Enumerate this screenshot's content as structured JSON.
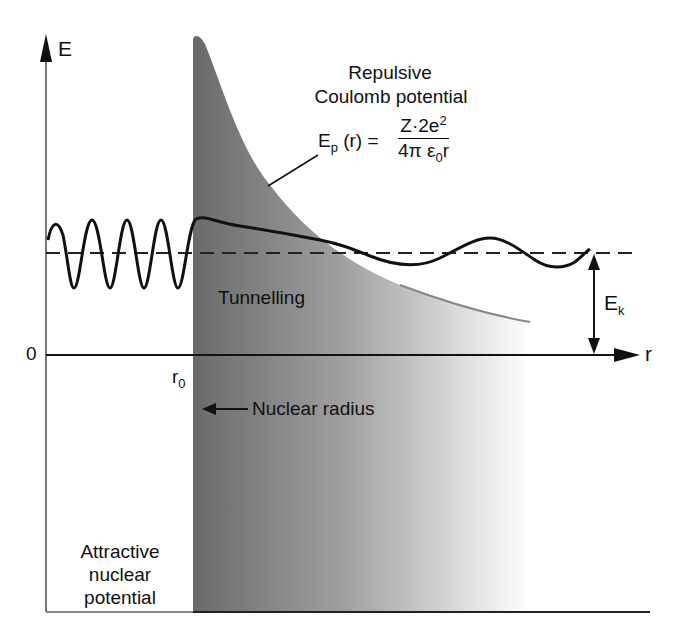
{
  "axes": {
    "y_label": "E",
    "x_label": "r",
    "origin_label": "0",
    "r0_label": "r",
    "r0_sub": "0"
  },
  "labels": {
    "repulsive_title_1": "Repulsive",
    "repulsive_title_2": "Coulomb potential",
    "tunnelling": "Tunnelling",
    "nuclear_radius": "Nuclear radius",
    "attractive_1": "Attractive",
    "attractive_2": "nuclear",
    "attractive_3": "potential",
    "ek_main": "E",
    "ek_sub": "k"
  },
  "formula": {
    "lhs_main": "E",
    "lhs_sub": "p",
    "lhs_rest": "(r) =",
    "numerator_main": "Z·2e",
    "numerator_sup": "2",
    "denominator_main": "4π ε",
    "denominator_sub": "0",
    "denominator_rest": "r"
  },
  "colors": {
    "barrier_dark": "#6e6e6e",
    "barrier_light": "#ffffff",
    "line": "#111111"
  }
}
